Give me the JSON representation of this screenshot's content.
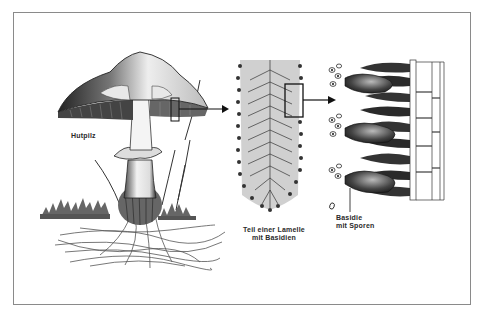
{
  "diagram": {
    "title_visible": false,
    "stages": [
      {
        "id": "mushroom",
        "label": "Hutpilz"
      },
      {
        "id": "gill-section",
        "label_line1": "Teil einer Lamelle",
        "label_line2": "mit Basidien"
      },
      {
        "id": "basidia-detail",
        "label_line1": "Basidie",
        "label_line2": "mit Sporen"
      }
    ],
    "arrows": [
      {
        "from": "mushroom-cap-inset-box",
        "to": "gill-section"
      },
      {
        "from": "gill-section-inset-box",
        "to": "basidia-detail"
      }
    ],
    "colors": {
      "ink": "#1a1a1a",
      "frame": "#8a8a8a",
      "paper": "#ffffff",
      "mid_gray": "#9a9a9a"
    }
  }
}
